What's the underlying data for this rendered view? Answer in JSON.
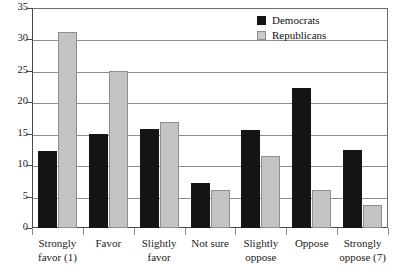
{
  "chart_data": {
    "type": "bar",
    "title": "",
    "xlabel": "",
    "ylabel": "",
    "ylim": [
      0,
      35
    ],
    "ytick_step": 5,
    "yticks": [
      0,
      5,
      10,
      15,
      20,
      25,
      30,
      35
    ],
    "grid": true,
    "legend_position": "top-right",
    "categories": [
      "Strongly favor (1)",
      "Favor",
      "Slightly favor",
      "Not sure",
      "Slightly oppose",
      "Oppose",
      "Strongly oppose (7)"
    ],
    "category_lines": [
      [
        "Strongly",
        "favor (1)"
      ],
      [
        "Favor",
        ""
      ],
      [
        "Slightly",
        "favor"
      ],
      [
        "Not sure",
        ""
      ],
      [
        "Slightly",
        "oppose"
      ],
      [
        "Oppose",
        ""
      ],
      [
        "Strongly",
        "oppose (7)"
      ]
    ],
    "series": [
      {
        "name": "Democrats",
        "color": "#151515",
        "values": [
          12.3,
          15.0,
          15.7,
          7.2,
          15.6,
          22.3,
          12.4
        ]
      },
      {
        "name": "Republicans",
        "color": "#c4c4c4",
        "values": [
          31.2,
          25.0,
          16.9,
          6.1,
          11.5,
          6.1,
          3.7
        ]
      }
    ]
  },
  "legend": {
    "items": [
      {
        "label": "Democrats",
        "swatch": "black-square-icon"
      },
      {
        "label": "Republicans",
        "swatch": "gray-square-icon"
      }
    ]
  }
}
